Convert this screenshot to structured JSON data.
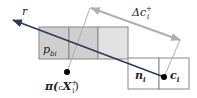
{
  "labels": {
    "ray": "r",
    "delta_prefix": "Δc",
    "delta_sub": "i",
    "delta_sup": "+",
    "p_bi": "p",
    "p_bi_sub": "bi",
    "proj": "π(",
    "proj_c": "c",
    "proj_X": "X",
    "proj_sub": "i",
    "proj_sup": "+",
    "proj_close": ")",
    "n_i": "n",
    "n_i_sub": "i",
    "c_i": "c",
    "c_i_sub": "i"
  },
  "colors": {
    "ray": "#2a3a5a",
    "gray_arrow": "#b0b0b0",
    "cell_fill": "#cfcfcf",
    "cell_fill_light": "#e2e2e2"
  }
}
